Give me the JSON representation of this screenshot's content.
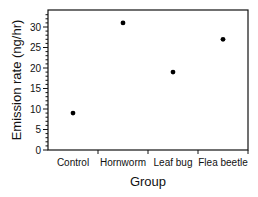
{
  "chart_data": {
    "type": "scatter",
    "title": "",
    "xlabel": "Group",
    "ylabel": "Emission rate (ng/hr)",
    "categories": [
      "Control",
      "Hornworm",
      "Leaf bug",
      "Flea beetle"
    ],
    "values": [
      9,
      31,
      19,
      27
    ],
    "ylim": [
      0,
      33
    ],
    "yticks": [
      0,
      5,
      10,
      15,
      20,
      25,
      30
    ],
    "grid": false,
    "legend": null
  },
  "colors": {
    "axis": "#111111",
    "point": "#000000"
  }
}
